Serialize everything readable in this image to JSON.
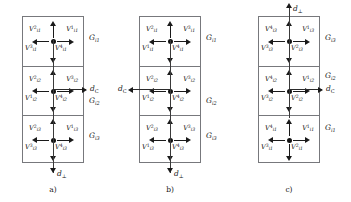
{
  "figure": {
    "panels": [
      {
        "id": "a",
        "caption": "a)",
        "group_labels": [
          "G",
          "G",
          "G"
        ],
        "group_subs": [
          "i1",
          "i2",
          "i3"
        ],
        "cells": [
          {
            "group_sub": "i1",
            "labels": {
              "top_left": {
                "base": "V",
                "sub": "i1",
                "sup": "2"
              },
              "top_right": {
                "base": "V",
                "sub": "i1",
                "sup": "1"
              },
              "bottom_left": {
                "base": "V",
                "sub": "i1",
                "sup": "3"
              },
              "bottom_right": {
                "base": "V",
                "sub": "i1",
                "sup": "4"
              }
            }
          },
          {
            "group_sub": "i2",
            "labels": {
              "top_left": {
                "base": "V",
                "sub": "i2",
                "sup": "2"
              },
              "top_right": {
                "base": "V",
                "sub": "i2",
                "sup": "3"
              },
              "bottom_left": {
                "base": "V",
                "sub": "i2",
                "sup": "1"
              },
              "bottom_right": {
                "base": "V",
                "sub": "i2",
                "sup": "4"
              }
            }
          },
          {
            "group_sub": "i3",
            "labels": {
              "top_left": {
                "base": "V",
                "sub": "i3",
                "sup": "2"
              },
              "top_right": {
                "base": "V",
                "sub": "i3",
                "sup": "1"
              },
              "bottom_left": {
                "base": "V",
                "sub": "i3",
                "sup": "3"
              },
              "bottom_right": {
                "base": "V",
                "sub": "i3",
                "sup": "4"
              }
            }
          }
        ],
        "dc": {
          "base": "d",
          "sub": "C",
          "direction": "right"
        },
        "dperp": {
          "base": "d",
          "sub": "⊥",
          "direction": "down"
        }
      },
      {
        "id": "b",
        "caption": "b)",
        "group_labels": [
          "G",
          "G",
          "G"
        ],
        "group_subs": [
          "i1",
          "i2",
          "i3"
        ],
        "cells": [
          {
            "group_sub": "i1",
            "labels": {
              "top_left": {
                "base": "V",
                "sub": "i1",
                "sup": "2"
              },
              "top_right": {
                "base": "V",
                "sub": "i1",
                "sup": "3"
              },
              "bottom_left": {
                "base": "V",
                "sub": "i1",
                "sup": "1"
              },
              "bottom_right": {
                "base": "V",
                "sub": "i1",
                "sup": "4"
              }
            }
          },
          {
            "group_sub": "i2",
            "labels": {
              "top_left": {
                "base": "V",
                "sub": "i2",
                "sup": "2"
              },
              "top_right": {
                "base": "V",
                "sub": "i2",
                "sup": "3"
              },
              "bottom_left": {
                "base": "V",
                "sub": "i2",
                "sup": "1"
              },
              "bottom_right": {
                "base": "V",
                "sub": "i2",
                "sup": "4"
              }
            }
          },
          {
            "group_sub": "i3",
            "labels": {
              "top_left": {
                "base": "V",
                "sub": "i3",
                "sup": "2"
              },
              "top_right": {
                "base": "V",
                "sub": "i3",
                "sup": "3"
              },
              "bottom_left": {
                "base": "V",
                "sub": "i3",
                "sup": "1"
              },
              "bottom_right": {
                "base": "V",
                "sub": "i3",
                "sup": "4"
              }
            }
          }
        ],
        "dc": {
          "base": "d",
          "sub": "C",
          "direction": "left"
        },
        "dperp": {
          "base": "d",
          "sub": "⊥",
          "direction": "down"
        }
      },
      {
        "id": "c",
        "caption": "c)",
        "group_labels": [
          "G",
          "G",
          "G"
        ],
        "group_subs": [
          "i3",
          "i2",
          "i1"
        ],
        "cells": [
          {
            "group_sub": "i3",
            "labels": {
              "top_left": {
                "base": "V",
                "sub": "i3",
                "sup": "4"
              },
              "top_right": {
                "base": "V",
                "sub": "i3",
                "sup": "1"
              },
              "bottom_left": {
                "base": "V",
                "sub": "i3",
                "sup": "3"
              },
              "bottom_right": {
                "base": "V",
                "sub": "i3",
                "sup": "2"
              }
            }
          },
          {
            "group_sub": "i2",
            "labels": {
              "top_left": {
                "base": "V",
                "sub": "i2",
                "sup": "4"
              },
              "top_right": {
                "base": "V",
                "sub": "i2",
                "sup": "1"
              },
              "bottom_left": {
                "base": "V",
                "sub": "i2",
                "sup": "3"
              },
              "bottom_right": {
                "base": "V",
                "sub": "i2",
                "sup": "2"
              }
            }
          },
          {
            "group_sub": "i1",
            "labels": {
              "top_left": {
                "base": "V",
                "sub": "i1",
                "sup": "4"
              },
              "top_right": {
                "base": "V",
                "sub": "i1",
                "sup": "1"
              },
              "bottom_left": {
                "base": "V",
                "sub": "i1",
                "sup": "3"
              },
              "bottom_right": {
                "base": "V",
                "sub": "i1",
                "sup": "2"
              }
            }
          }
        ],
        "dc": {
          "base": "d",
          "sub": "C",
          "direction": "right"
        },
        "dperp": {
          "base": "d",
          "sub": "⊥",
          "direction": "up"
        }
      }
    ],
    "colors": {
      "box_stroke": "#77787c",
      "arrow": "#1a1a1a",
      "text": "#101010",
      "background": "#ffffff"
    }
  }
}
